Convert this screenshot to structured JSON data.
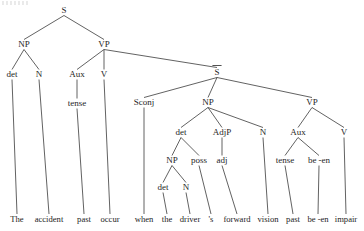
{
  "figure": {
    "sentence": "The accident past occur when the driver 's forward vision past be -en impair",
    "background_color": "#ffffff",
    "line_color": "#3a3a3a",
    "text_color": "#262626"
  },
  "nodes": [
    {
      "id": "S_root",
      "label": "S",
      "x": 64,
      "y": 13,
      "overbar": false,
      "terminal": false
    },
    {
      "id": "NP_subj",
      "label": "NP",
      "x": 24,
      "y": 47,
      "overbar": false,
      "terminal": false
    },
    {
      "id": "VP_main",
      "label": "VP",
      "x": 104,
      "y": 47,
      "overbar": false,
      "terminal": false
    },
    {
      "id": "det_subj",
      "label": "det",
      "x": 12,
      "y": 77,
      "overbar": false,
      "terminal": false
    },
    {
      "id": "N_subj",
      "label": "N",
      "x": 39,
      "y": 77,
      "overbar": false,
      "terminal": false
    },
    {
      "id": "Aux_main",
      "label": "Aux",
      "x": 77,
      "y": 77,
      "overbar": false,
      "terminal": false
    },
    {
      "id": "V_main",
      "label": "V",
      "x": 104,
      "y": 77,
      "overbar": false,
      "terminal": false
    },
    {
      "id": "Sbar",
      "label": "S",
      "x": 217,
      "y": 75,
      "overbar": true,
      "terminal": false
    },
    {
      "id": "tense_main",
      "label": "tense",
      "x": 77,
      "y": 106,
      "overbar": false,
      "terminal": false
    },
    {
      "id": "Sconj",
      "label": "Sconj",
      "x": 144,
      "y": 105,
      "overbar": false,
      "terminal": false
    },
    {
      "id": "NP_emb",
      "label": "NP",
      "x": 208,
      "y": 105,
      "overbar": false,
      "terminal": false
    },
    {
      "id": "VP_emb",
      "label": "VP",
      "x": 312,
      "y": 105,
      "overbar": false,
      "terminal": false
    },
    {
      "id": "det_emb",
      "label": "det",
      "x": 181,
      "y": 135,
      "overbar": false,
      "terminal": false
    },
    {
      "id": "AdjP",
      "label": "AdjP",
      "x": 222,
      "y": 135,
      "overbar": false,
      "terminal": false
    },
    {
      "id": "N_emb",
      "label": "N",
      "x": 263,
      "y": 135,
      "overbar": false,
      "terminal": false
    },
    {
      "id": "Aux_emb",
      "label": "Aux",
      "x": 298,
      "y": 135,
      "overbar": false,
      "terminal": false
    },
    {
      "id": "V_emb",
      "label": "V",
      "x": 344,
      "y": 135,
      "overbar": false,
      "terminal": false
    },
    {
      "id": "NP_poss",
      "label": "NP",
      "x": 172,
      "y": 163,
      "overbar": false,
      "terminal": false
    },
    {
      "id": "poss",
      "label": "poss",
      "x": 199,
      "y": 163,
      "overbar": false,
      "terminal": false
    },
    {
      "id": "adj",
      "label": "adj",
      "x": 222,
      "y": 163,
      "overbar": false,
      "terminal": false
    },
    {
      "id": "tense_emb",
      "label": "tense",
      "x": 285,
      "y": 163,
      "overbar": false,
      "terminal": false
    },
    {
      "id": "been",
      "label": "be -en",
      "x": 319,
      "y": 163,
      "overbar": false,
      "terminal": false
    },
    {
      "id": "det_poss",
      "label": "det",
      "x": 163,
      "y": 190,
      "overbar": false,
      "terminal": false
    },
    {
      "id": "N_poss",
      "label": "N",
      "x": 186,
      "y": 190,
      "overbar": false,
      "terminal": false
    },
    {
      "id": "t_the",
      "label": "The",
      "x": 17,
      "y": 222,
      "overbar": false,
      "terminal": true
    },
    {
      "id": "t_accident",
      "label": "accident",
      "x": 49,
      "y": 222,
      "overbar": false,
      "terminal": true
    },
    {
      "id": "t_past1",
      "label": "past",
      "x": 84,
      "y": 222,
      "overbar": false,
      "terminal": true
    },
    {
      "id": "t_occur",
      "label": "occur",
      "x": 110,
      "y": 222,
      "overbar": false,
      "terminal": true
    },
    {
      "id": "t_when",
      "label": "when",
      "x": 144,
      "y": 222,
      "overbar": false,
      "terminal": true
    },
    {
      "id": "t_the2",
      "label": "the",
      "x": 167,
      "y": 222,
      "overbar": false,
      "terminal": true
    },
    {
      "id": "t_driver",
      "label": "driver",
      "x": 190,
      "y": 222,
      "overbar": false,
      "terminal": true
    },
    {
      "id": "t_s",
      "label": "'s",
      "x": 211,
      "y": 222,
      "overbar": false,
      "terminal": true
    },
    {
      "id": "t_forward",
      "label": "forward",
      "x": 237,
      "y": 222,
      "overbar": false,
      "terminal": true
    },
    {
      "id": "t_vision",
      "label": "vision",
      "x": 268,
      "y": 222,
      "overbar": false,
      "terminal": true
    },
    {
      "id": "t_past2",
      "label": "past",
      "x": 293,
      "y": 222,
      "overbar": false,
      "terminal": true
    },
    {
      "id": "t_been",
      "label": "be -en",
      "x": 318,
      "y": 222,
      "overbar": false,
      "terminal": true
    },
    {
      "id": "t_impair",
      "label": "impair",
      "x": 346,
      "y": 222,
      "overbar": false,
      "terminal": true
    }
  ],
  "edges": [
    {
      "from": "S_root",
      "to": "NP_subj"
    },
    {
      "from": "S_root",
      "to": "VP_main"
    },
    {
      "from": "NP_subj",
      "to": "det_subj"
    },
    {
      "from": "NP_subj",
      "to": "N_subj"
    },
    {
      "from": "VP_main",
      "to": "Aux_main"
    },
    {
      "from": "VP_main",
      "to": "V_main"
    },
    {
      "from": "VP_main",
      "to": "Sbar"
    },
    {
      "from": "Aux_main",
      "to": "tense_main"
    },
    {
      "from": "Sbar",
      "to": "Sconj"
    },
    {
      "from": "Sbar",
      "to": "NP_emb"
    },
    {
      "from": "Sbar",
      "to": "VP_emb"
    },
    {
      "from": "NP_emb",
      "to": "det_emb"
    },
    {
      "from": "NP_emb",
      "to": "AdjP"
    },
    {
      "from": "NP_emb",
      "to": "N_emb"
    },
    {
      "from": "VP_emb",
      "to": "Aux_emb"
    },
    {
      "from": "VP_emb",
      "to": "V_emb"
    },
    {
      "from": "det_emb",
      "to": "NP_poss"
    },
    {
      "from": "det_emb",
      "to": "poss"
    },
    {
      "from": "AdjP",
      "to": "adj"
    },
    {
      "from": "Aux_emb",
      "to": "tense_emb"
    },
    {
      "from": "Aux_emb",
      "to": "been"
    },
    {
      "from": "NP_poss",
      "to": "det_poss"
    },
    {
      "from": "NP_poss",
      "to": "N_poss"
    },
    {
      "from": "det_subj",
      "to": "t_the"
    },
    {
      "from": "N_subj",
      "to": "t_accident"
    },
    {
      "from": "tense_main",
      "to": "t_past1"
    },
    {
      "from": "V_main",
      "to": "t_occur"
    },
    {
      "from": "Sconj",
      "to": "t_when"
    },
    {
      "from": "det_poss",
      "to": "t_the2"
    },
    {
      "from": "N_poss",
      "to": "t_driver"
    },
    {
      "from": "poss",
      "to": "t_s"
    },
    {
      "from": "adj",
      "to": "t_forward"
    },
    {
      "from": "N_emb",
      "to": "t_vision"
    },
    {
      "from": "tense_emb",
      "to": "t_past2"
    },
    {
      "from": "been",
      "to": "t_been"
    },
    {
      "from": "V_emb",
      "to": "t_impair"
    }
  ]
}
